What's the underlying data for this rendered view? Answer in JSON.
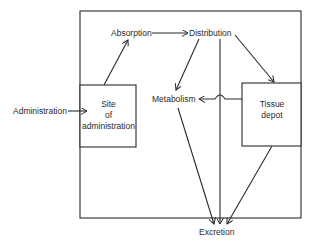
{
  "diagram": {
    "nodes": {
      "administration": "Administration",
      "absorption": "Absorption",
      "distribution": "Distribution",
      "metabolism": "Metabolism",
      "excretion": "Excretion",
      "site_line1": "Site",
      "site_line2": "of",
      "site_line3": "administration",
      "tissue_line1": "Tissue",
      "tissue_line2": "depot"
    },
    "edges": [
      {
        "from": "Administration",
        "to": "Site of administration"
      },
      {
        "from": "Site of administration",
        "to": "Absorption"
      },
      {
        "from": "Absorption",
        "to": "Distribution"
      },
      {
        "from": "Distribution",
        "to": "Metabolism"
      },
      {
        "from": "Distribution",
        "to": "Excretion"
      },
      {
        "from": "Distribution",
        "to": "Tissue depot"
      },
      {
        "from": "Tissue depot",
        "to": "Metabolism"
      },
      {
        "from": "Metabolism",
        "to": "Excretion"
      },
      {
        "from": "Tissue depot",
        "to": "Excretion"
      }
    ],
    "colors": {
      "line": "#2a2a2a",
      "background": "#ffffff"
    }
  }
}
